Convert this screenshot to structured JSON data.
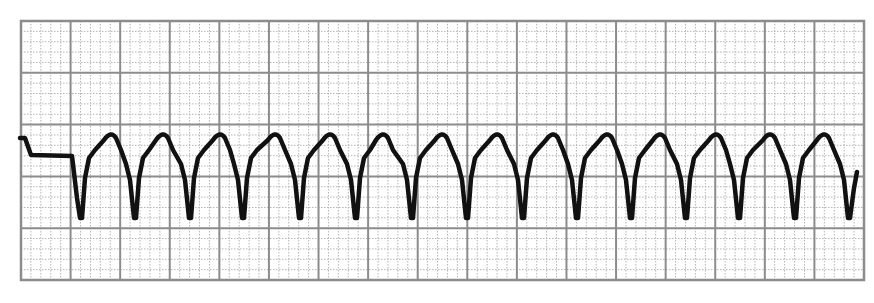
{
  "chart_data": {
    "type": "line",
    "title": "",
    "xlabel": "",
    "ylabel": "",
    "grid": {
      "on": true,
      "left": 21,
      "top": 21,
      "right": 864,
      "bottom": 280,
      "major_columns": 17,
      "major_rows": 5,
      "minor_per_major": 5,
      "major_color": "#8c8c8c",
      "minor_color": "#b4b4b4"
    },
    "trace_color": "#111111",
    "baseline_y": 156,
    "complex_count": 15,
    "trough_x": [
      81,
      135,
      190,
      243,
      300,
      356,
      412,
      467,
      523,
      577,
      631,
      686,
      739,
      795,
      849
    ],
    "trough_y": 218,
    "peak_x": [
      111,
      163,
      220,
      275,
      330,
      383,
      442,
      497,
      553,
      607,
      660,
      716,
      770,
      824
    ],
    "peak_y": 134,
    "start_segment": [
      [
        20,
        138
      ],
      [
        25,
        138
      ],
      [
        31,
        155
      ],
      [
        72,
        156
      ]
    ],
    "end_point": [
      857,
      172
    ]
  }
}
